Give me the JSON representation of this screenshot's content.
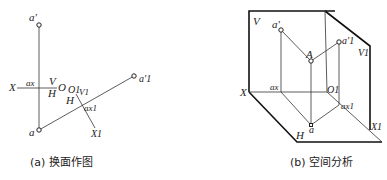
{
  "figure_a": {
    "caption": "(a) 换面作图",
    "labels": {
      "a_prime": "a'",
      "a": "a",
      "X": "X",
      "ax": "ax",
      "V": "V",
      "H": "H",
      "O": "O",
      "O1": "O1",
      "V1": "V1",
      "H2": "H",
      "ax1": "ax1",
      "X1": "X1",
      "a1_prime": "a'1"
    }
  },
  "figure_b": {
    "caption": "(b) 空间分析",
    "labels": {
      "V": "V",
      "a_prime": "a'",
      "A": "A",
      "a1_prime": "a'1",
      "V1": "V1",
      "X": "X",
      "ax": "ax",
      "O1": "O1",
      "ax1": "ax1",
      "a": "a",
      "H": "H",
      "X1": "X1"
    }
  }
}
